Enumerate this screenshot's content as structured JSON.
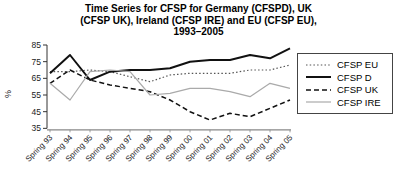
{
  "title_lines": [
    "Time Series for CFSP for Germany (CFSPD), UK",
    "(CFSP UK), Ireland (CFSP IRE) and EU (CFSP EU),",
    "1993–2005"
  ],
  "chart_data": {
    "type": "line",
    "title": "Time Series for CFSP for Germany (CFSPD), UK (CFSP UK), Ireland (CFSP IRE) and EU (CFSP EU), 1993–2005",
    "xlabel": "",
    "ylabel": "%",
    "ylim": [
      35,
      85
    ],
    "yticks": [
      35,
      45,
      55,
      65,
      75,
      85
    ],
    "grid": false,
    "legend_position": "right",
    "categories": [
      "Spring 93",
      "Spring 94",
      "Spring 95",
      "Spring 96",
      "Spring 97",
      "Spring 98",
      "Spring 99",
      "Spring 00",
      "Spring 01",
      "Spring 02",
      "Spring 03",
      "Spring 04",
      "Spring 05"
    ],
    "series": [
      {
        "name": "CFSP EU",
        "line_style": "dotted",
        "color": "#555555",
        "stroke_width": 1.2,
        "values": [
          69,
          69,
          70,
          69,
          66,
          63,
          67,
          68,
          68,
          68,
          70,
          70,
          73
        ]
      },
      {
        "name": "CFSP D",
        "line_style": "solid",
        "color": "#111111",
        "stroke_width": 2,
        "values": [
          68,
          79,
          64,
          69,
          70,
          70,
          71,
          75,
          76,
          76,
          79,
          77,
          83
        ]
      },
      {
        "name": "CFSP UK",
        "line_style": "dashed",
        "color": "#111111",
        "stroke_width": 1.5,
        "values": [
          62,
          70,
          64,
          61,
          59,
          57,
          52,
          45,
          40,
          44,
          42,
          47,
          52
        ]
      },
      {
        "name": "CFSP IRE",
        "line_style": "solid",
        "color": "#aaaaaa",
        "stroke_width": 1.2,
        "values": [
          62,
          52,
          69,
          70,
          69,
          55,
          56,
          59,
          59,
          57,
          54,
          62,
          59
        ]
      }
    ]
  },
  "axis_colors": {
    "y_axis": "#333333",
    "x_axis": "#888888",
    "tick_label": "#222222"
  }
}
